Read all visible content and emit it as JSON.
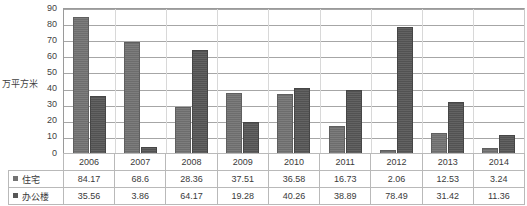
{
  "chart_data": {
    "type": "bar",
    "title": "",
    "xlabel": "",
    "ylabel": "万平方米",
    "ylim": [
      0,
      90
    ],
    "ytick_step": 10,
    "yticks": [
      "90",
      "80",
      "70",
      "60",
      "50",
      "40",
      "30",
      "20",
      "10",
      "0"
    ],
    "grid": true,
    "legend_position": "table-left",
    "categories": [
      "2006",
      "2007",
      "2008",
      "2009",
      "2010",
      "2011",
      "2012",
      "2013",
      "2014"
    ],
    "series": [
      {
        "name": "住宅",
        "color": "#737373",
        "values": [
          84.17,
          68.6,
          28.36,
          37.51,
          36.58,
          16.73,
          2.06,
          12.53,
          3.24
        ],
        "labels": [
          "84.17",
          "68.6",
          "28.36",
          "37.51",
          "36.58",
          "16.73",
          "2.06",
          "12.53",
          "3.24"
        ]
      },
      {
        "name": "办公楼",
        "color": "#575757",
        "values": [
          35.56,
          3.86,
          64.17,
          19.28,
          40.26,
          38.89,
          78.49,
          31.42,
          11.36
        ],
        "labels": [
          "35.56",
          "3.86",
          "64.17",
          "19.28",
          "40.26",
          "38.89",
          "78.49",
          "31.42",
          "11.36"
        ]
      }
    ]
  },
  "table": {
    "corner_label": ""
  }
}
